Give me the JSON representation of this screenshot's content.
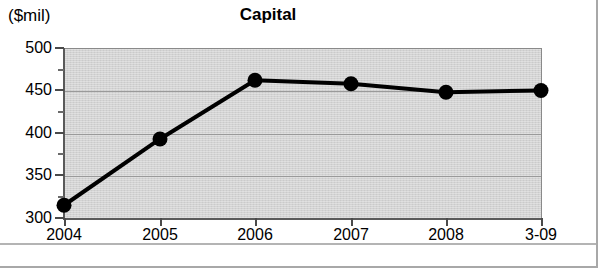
{
  "figure": {
    "units_label": "($mil)",
    "title": "Capital"
  },
  "chart_data": {
    "type": "line",
    "title": "Capital",
    "subtitle": "",
    "xlabel": "",
    "ylabel": "($mil)",
    "categories": [
      "2004",
      "2005",
      "2006",
      "2007",
      "2008",
      "3-09"
    ],
    "values": [
      315,
      393,
      462,
      458,
      448,
      450
    ],
    "series": [
      {
        "name": "Capital",
        "values": [
          315,
          393,
          462,
          458,
          448,
          450
        ],
        "color": "#000000",
        "marker": "filled-circle",
        "line_width": 3
      }
    ],
    "ylim": [
      300,
      500
    ],
    "ytick_labels": [
      "500",
      "450",
      "400",
      "350",
      "300"
    ],
    "ytick_values": [
      500,
      450,
      400,
      350,
      300
    ],
    "yminor_tick_values": [
      475,
      425,
      375,
      325
    ],
    "xtick_labels": [
      "2004",
      "2005",
      "2006",
      "2007",
      "2008",
      "3-09"
    ],
    "grid": "horizontal-major",
    "legend": "none",
    "plot_background": "#d3d3d3",
    "annotations": []
  }
}
